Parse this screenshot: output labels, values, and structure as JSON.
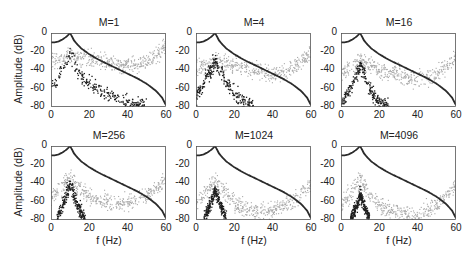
{
  "figure": {
    "ylabel": "Amplitude (dB)",
    "xlabel": "f (Hz)",
    "xticks": [
      "0",
      "20",
      "40",
      "60"
    ],
    "yticks": [
      "0",
      "-20",
      "-40",
      "-60",
      "-80"
    ]
  },
  "chart_data": {
    "type": "scatter",
    "layout": "2x3 subplot grid",
    "xlabel": "f (Hz)",
    "ylabel": "Amplitude (dB)",
    "xlim": [
      0,
      60
    ],
    "ylim": [
      -80,
      0
    ],
    "grid": false,
    "legend": null,
    "series_description": {
      "solid_curve": "dark line: reference spectrum peaking at 0 dB near 10 Hz, ~-10 dB at 0 Hz, decaying to ~-78 dB at 60 Hz",
      "gray_points": "light gray scatter: spectral estimate",
      "black_points": "dark scatter: error spectrum peaking near 10 Hz"
    },
    "reference_curve": {
      "x": [
        0,
        2,
        4,
        6,
        8,
        9,
        10,
        11,
        12,
        14,
        16,
        20,
        25,
        30,
        35,
        40,
        45,
        50,
        55,
        58,
        60
      ],
      "y": [
        -10,
        -10,
        -9,
        -7,
        -4,
        -2,
        0,
        -4,
        -8,
        -13,
        -17,
        -23,
        -29,
        -34,
        -39,
        -44,
        -49,
        -55,
        -63,
        -70,
        -78
      ]
    },
    "panels": [
      {
        "title": "M=1",
        "gray": {
          "x": [
            0,
            10,
            20,
            30,
            40,
            50,
            60
          ],
          "y": [
            -30,
            -25,
            -28,
            -32,
            -35,
            -30,
            -15
          ]
        },
        "black": {
          "x": [
            0,
            5,
            10,
            15,
            20,
            30,
            40,
            50
          ],
          "y": [
            -60,
            -45,
            -25,
            -45,
            -55,
            -68,
            -75,
            -78
          ]
        }
      },
      {
        "title": "M=4",
        "gray": {
          "x": [
            0,
            10,
            20,
            30,
            40,
            50,
            60
          ],
          "y": [
            -40,
            -30,
            -35,
            -40,
            -45,
            -38,
            -22
          ]
        },
        "black": {
          "x": [
            0,
            5,
            10,
            15,
            20,
            25,
            30
          ],
          "y": [
            -70,
            -50,
            -30,
            -50,
            -65,
            -75,
            -80
          ]
        }
      },
      {
        "title": "M=16",
        "gray": {
          "x": [
            0,
            10,
            20,
            30,
            40,
            50,
            60
          ],
          "y": [
            -45,
            -30,
            -40,
            -45,
            -52,
            -45,
            -25
          ]
        },
        "black": {
          "x": [
            0,
            5,
            10,
            15,
            20,
            25
          ],
          "y": [
            -78,
            -60,
            -35,
            -60,
            -75,
            -80
          ]
        }
      },
      {
        "title": "M=256",
        "gray": {
          "x": [
            0,
            10,
            20,
            30,
            40,
            50,
            60
          ],
          "y": [
            -55,
            -35,
            -55,
            -60,
            -62,
            -55,
            -35
          ]
        },
        "black": {
          "x": [
            3,
            6,
            10,
            14,
            18
          ],
          "y": [
            -80,
            -65,
            -42,
            -65,
            -80
          ]
        }
      },
      {
        "title": "M=1024",
        "gray": {
          "x": [
            0,
            10,
            20,
            30,
            40,
            50,
            60
          ],
          "y": [
            -62,
            -37,
            -62,
            -70,
            -70,
            -60,
            -42
          ]
        },
        "black": {
          "x": [
            4,
            7,
            10,
            13,
            16
          ],
          "y": [
            -80,
            -65,
            -48,
            -65,
            -80
          ]
        }
      },
      {
        "title": "M=4096",
        "gray": {
          "x": [
            0,
            10,
            20,
            30,
            40,
            50,
            60
          ],
          "y": [
            -65,
            -37,
            -65,
            -72,
            -75,
            -65,
            -42
          ]
        },
        "black": {
          "x": [
            5,
            8,
            10,
            12,
            15
          ],
          "y": [
            -80,
            -65,
            -52,
            -65,
            -80
          ]
        }
      }
    ]
  },
  "colors": {
    "curve": "#2a2a2a",
    "gray_points": "#a8a8a8",
    "black_points": "#1e1e1e",
    "axes": "#555555"
  }
}
